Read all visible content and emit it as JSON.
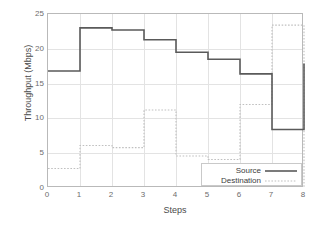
{
  "chart_data": {
    "type": "line",
    "title": "",
    "xlabel": "Steps",
    "ylabel": "Throughput (Mbps)",
    "xlim": [
      0,
      8
    ],
    "ylim": [
      0,
      25
    ],
    "xticks": [
      0,
      1,
      2,
      3,
      4,
      5,
      6,
      7,
      8
    ],
    "yticks": [
      0,
      5,
      10,
      15,
      20,
      25
    ],
    "grid": true,
    "step_style": "post",
    "legend_position": "bottom-right",
    "series": [
      {
        "name": "Source",
        "color": "#5a5a5a",
        "linestyle": "solid",
        "x": [
          0,
          1,
          2,
          3,
          4,
          5,
          6,
          7,
          8
        ],
        "values": [
          16.8,
          23.0,
          22.7,
          21.3,
          19.5,
          18.5,
          16.4,
          8.4,
          17.9
        ]
      },
      {
        "name": "Destination",
        "color": "#c0c0c0",
        "linestyle": "dotted",
        "x": [
          0,
          1,
          2,
          3,
          4,
          5,
          6,
          7,
          8
        ],
        "values": [
          2.8,
          6.1,
          5.8,
          11.2,
          4.6,
          4.1,
          12.0,
          23.4,
          0.0
        ]
      }
    ]
  },
  "axes": {
    "ylabel_text": "Throughput (Mbps)",
    "xlabel_text": "Steps",
    "ytick_labels": [
      "25",
      "20",
      "15",
      "10",
      "5",
      "0"
    ],
    "xtick_labels": [
      "0",
      "1",
      "2",
      "3",
      "4",
      "5",
      "6",
      "7",
      "8"
    ]
  },
  "legend": {
    "entries": [
      {
        "label": "Source",
        "style": "solid"
      },
      {
        "label": "Destination",
        "style": "dotted"
      }
    ]
  }
}
